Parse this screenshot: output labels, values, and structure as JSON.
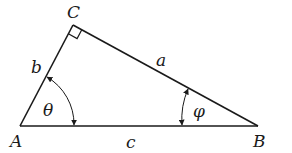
{
  "diagram": {
    "type": "right-triangle",
    "vertices": {
      "A": {
        "label": "A",
        "x": 20,
        "y": 126
      },
      "B": {
        "label": "B",
        "x": 258,
        "y": 126
      },
      "C": {
        "label": "C",
        "x": 73,
        "y": 25
      }
    },
    "sides": {
      "a": {
        "label": "a",
        "from": "C",
        "to": "B"
      },
      "b": {
        "label": "b",
        "from": "A",
        "to": "C"
      },
      "c": {
        "label": "c",
        "from": "A",
        "to": "B"
      }
    },
    "angles": {
      "theta": {
        "label": "θ",
        "at": "A"
      },
      "phi": {
        "label": "φ",
        "at": "B"
      },
      "right": {
        "at": "C"
      }
    },
    "colors": {
      "stroke": "#1a1a1a",
      "background": "#ffffff"
    }
  }
}
